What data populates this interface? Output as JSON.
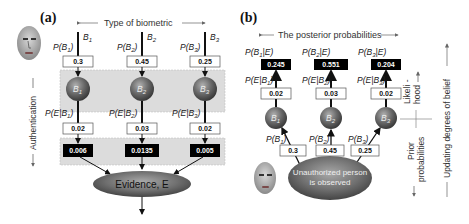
{
  "panel_a": {
    "label": "(a)",
    "header": "Type of biometric",
    "side_axis": "Authentication",
    "biometrics": [
      {
        "name": "B",
        "sub": "1",
        "prior_label": "P(B1)",
        "prior": "0.3",
        "node": "B1",
        "lik_label": "P(E|B1)",
        "likelihood": "0.02",
        "joint": "0.006"
      },
      {
        "name": "B",
        "sub": "2",
        "prior_label": "P(B2)",
        "prior": "0.45",
        "node": "B2",
        "lik_label": "P(E|B2)",
        "likelihood": "0.03",
        "joint": "0.0135"
      },
      {
        "name": "B",
        "sub": "3",
        "prior_label": "P(B3)",
        "prior": "0.25",
        "node": "B3",
        "lik_label": "P(E|B3)",
        "likelihood": "0.02",
        "joint": "0.005"
      }
    ],
    "evidence": "Evidence, E"
  },
  "panel_b": {
    "label": "(b)",
    "header": "The posterior probabilities",
    "biometrics": [
      {
        "post_label": "P(B1|E)",
        "posterior": "0.245",
        "lik_label": "P(E|B1)",
        "likelihood": "0.02",
        "node": "B1",
        "prior_label": "P(B1)",
        "prior": "0.3"
      },
      {
        "post_label": "P(B2|E)",
        "posterior": "0.551",
        "lik_label": "P(E|B2)",
        "likelihood": "0.03",
        "node": "B2",
        "prior_label": "P(B2)",
        "prior": "0.45"
      },
      {
        "post_label": "P(B3|E)",
        "posterior": "0.204",
        "lik_label": "P(E|B3)",
        "likelihood": "0.02",
        "node": "B3",
        "prior_label": "P(B3)",
        "prior": "0.25"
      }
    ],
    "observation": [
      "Unauthorized person",
      "is observed"
    ],
    "side_labels": {
      "likelihood": [
        "Likeli -",
        "hood"
      ],
      "prior": [
        "Prior",
        "probabilities"
      ],
      "updating": "Updating  degrees of belief"
    }
  }
}
